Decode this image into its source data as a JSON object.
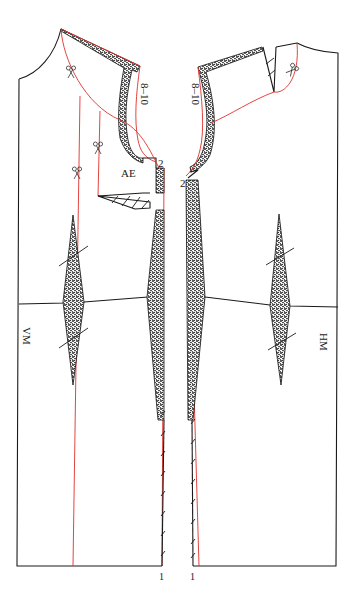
{
  "diagram": {
    "colors": {
      "outline": "#1a1a1a",
      "modification_line": "#e0302a",
      "facing_fill": "stippled black"
    },
    "labels": {
      "front_center": "VM",
      "back_center": "HM",
      "armhole_extension": "AE",
      "facing_width_front": "8–10",
      "facing_width_back": "8–10",
      "shoulder_offset_front": "2",
      "shoulder_offset_back": "2",
      "hem_mark_front": "1",
      "hem_mark_back": "1"
    },
    "pieces": [
      {
        "name": "front",
        "center_label": "VM",
        "darts": 1,
        "scissor_marks": 3
      },
      {
        "name": "back",
        "center_label": "HM",
        "darts": 1,
        "scissor_marks": 1
      }
    ],
    "icons": [
      "scissors-icon",
      "scissors-icon",
      "scissors-icon",
      "scissors-icon"
    ]
  }
}
